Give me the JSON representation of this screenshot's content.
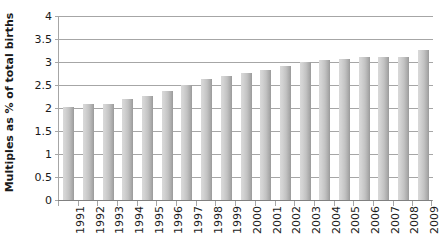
{
  "chart_data": {
    "type": "bar",
    "title": "",
    "xlabel": "",
    "ylabel": "Multiples as % of total births",
    "ylim": [
      0,
      4
    ],
    "ytick_labels": [
      "4",
      "3.5",
      "3",
      "2.5",
      "2",
      "1.5",
      "1",
      "0.5",
      "0"
    ],
    "ytick_values": [
      4,
      3.5,
      3,
      2.5,
      2,
      1.5,
      1,
      0.5,
      0
    ],
    "grid": true,
    "legend": "none",
    "categories": [
      "1991",
      "1992",
      "1993",
      "1994",
      "1995",
      "1996",
      "1997",
      "1998",
      "1999",
      "2000",
      "2001",
      "2002",
      "2003",
      "2004",
      "2005",
      "2006",
      "2007",
      "2008",
      "2009"
    ],
    "values": [
      2.02,
      2.09,
      2.09,
      2.2,
      2.27,
      2.36,
      2.5,
      2.62,
      2.7,
      2.76,
      2.83,
      2.91,
      2.99,
      3.04,
      3.06,
      3.11,
      3.11,
      3.11,
      3.26
    ],
    "series": [
      {
        "name": "Multiples as % of total births",
        "values": [
          2.02,
          2.09,
          2.09,
          2.2,
          2.27,
          2.36,
          2.5,
          2.62,
          2.7,
          2.76,
          2.83,
          2.91,
          2.99,
          3.04,
          3.06,
          3.11,
          3.11,
          3.11,
          3.26
        ]
      }
    ],
    "colors": {
      "bar_light": "#d9d9d9",
      "bar_dark": "#9a9a9a",
      "gridline": "#a6a6a6",
      "axis": "#808080",
      "text": "#1a1a1a"
    }
  }
}
